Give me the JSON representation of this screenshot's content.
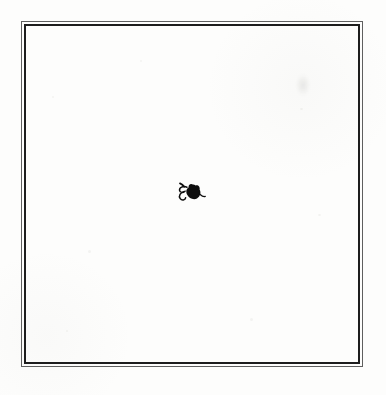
{
  "colors": {
    "page_background": "#fcfcfb",
    "paper": "#fdfdfc",
    "frame_outer_rule": "#5f5f5f",
    "frame_inner_rule": "#1d1d1d",
    "ornament_ink": "#0d0d0d",
    "smudge": "rgba(140,140,135,0.16)"
  },
  "ornament": {
    "icon": "fleuron-leaf-icon"
  }
}
